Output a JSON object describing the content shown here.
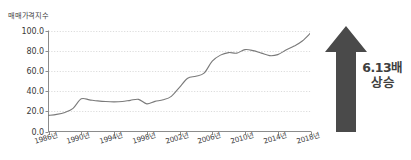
{
  "chart_data": {
    "type": "line",
    "title": "",
    "ylabel": "매매가격지수",
    "xlabel": "",
    "ylim": [
      0.0,
      100.0
    ],
    "grid": true,
    "legend": null,
    "ytick_labels": [
      "0.0",
      "20.0",
      "40.0",
      "60.0",
      "80.0",
      "100.0"
    ],
    "ytick_values": [
      0.0,
      20.0,
      40.0,
      60.0,
      80.0,
      100.0
    ],
    "xtick_labels": [
      "1986년",
      "1990년",
      "1994년",
      "1998년",
      "2002년",
      "2006년",
      "2010년",
      "2014년",
      "2018년"
    ],
    "xtick_values": [
      1986,
      1990,
      1994,
      1998,
      2002,
      2006,
      2010,
      2014,
      2018
    ],
    "xlim": [
      1986,
      2018
    ],
    "line_color": "#7a7a7a",
    "x": [
      1986,
      1987,
      1988,
      1989,
      1990,
      1991,
      1992,
      1993,
      1994,
      1995,
      1996,
      1997,
      1998,
      1999,
      2000,
      2001,
      2002,
      2003,
      2004,
      2005,
      2006,
      2007,
      2008,
      2009,
      2010,
      2011,
      2012,
      2013,
      2014,
      2015,
      2016,
      2017,
      2018
    ],
    "values": [
      16.0,
      17.0,
      19.0,
      23.0,
      32.5,
      31.5,
      30.5,
      29.8,
      29.5,
      29.8,
      31.0,
      32.0,
      27.5,
      30.0,
      31.5,
      35.0,
      44.0,
      53.0,
      55.0,
      58.0,
      70.0,
      76.0,
      78.5,
      78.0,
      81.5,
      80.5,
      78.0,
      75.5,
      76.5,
      81.0,
      85.0,
      90.0,
      98.0
    ]
  },
  "annotation": {
    "multiplier_label": "6.13배",
    "change_label": "상승",
    "arrow_direction": "up",
    "arrow_color": "#4a4a4a"
  }
}
